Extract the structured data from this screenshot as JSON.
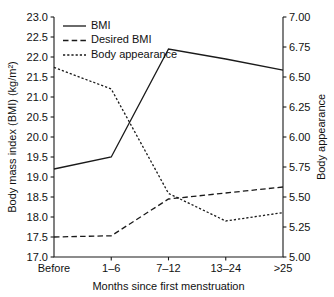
{
  "chart_data": {
    "type": "line",
    "title": "",
    "subtitle": "",
    "xlabel": "Months since first menstruation",
    "ylabel": "Body mass index (BMI) (kg/m²)",
    "y2label": "Body appearance",
    "categories": [
      "Before",
      "1–6",
      "7–12",
      "13–24",
      ">25"
    ],
    "ylim": [
      17.0,
      23.0
    ],
    "y2lim": [
      5.0,
      7.0
    ],
    "yticks": [
      "17.0",
      "17.5",
      "18.0",
      "18.5",
      "19.0",
      "19.5",
      "20.0",
      "20.5",
      "21.0",
      "21.5",
      "22.0",
      "22.5",
      "23.0"
    ],
    "ytick_values": [
      17.0,
      17.5,
      18.0,
      18.5,
      19.0,
      19.5,
      20.0,
      20.5,
      21.0,
      21.5,
      22.0,
      22.5,
      23.0
    ],
    "y2ticks": [
      "5.00",
      "5.25",
      "5.50",
      "5.75",
      "6.00",
      "6.25",
      "6.50",
      "6.75",
      "7.00"
    ],
    "y2tick_values": [
      5.0,
      5.25,
      5.5,
      5.75,
      6.0,
      6.25,
      6.5,
      6.75,
      7.0
    ],
    "grid": false,
    "legend_position": "top-left",
    "series": [
      {
        "name": "BMI",
        "axis": "left",
        "style": "solid",
        "values": [
          19.2,
          19.5,
          22.2,
          21.95,
          21.67
        ]
      },
      {
        "name": "Desired BMI",
        "axis": "left",
        "style": "dashed",
        "values": [
          17.5,
          17.53,
          18.45,
          18.6,
          18.75
        ]
      },
      {
        "name": "Body appearance",
        "axis": "right",
        "style": "dotted",
        "values": [
          6.58,
          6.4,
          5.53,
          5.3,
          5.37
        ]
      }
    ]
  },
  "legend": {
    "items": [
      {
        "label": "BMI",
        "style": "solid"
      },
      {
        "label": "Desired BMI",
        "style": "dashed"
      },
      {
        "label": "Body appearance",
        "style": "dotted"
      }
    ]
  }
}
